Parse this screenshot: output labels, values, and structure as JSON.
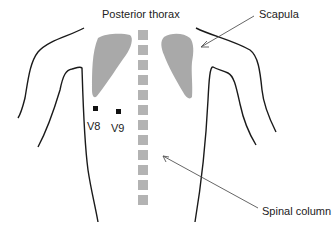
{
  "diagram": {
    "title": "Posterior thorax",
    "labels": {
      "scapula": "Scapula",
      "spinal_column": "Spinal column",
      "v8": "V8",
      "v9": "V9"
    },
    "colors": {
      "outline": "#1a1a1a",
      "scapula_fill": "#a9a9a9",
      "vertebra_fill": "#b3b3b3",
      "electrode": "#111111",
      "arrow": "#555555",
      "text": "#222222",
      "background": "#ffffff"
    },
    "vertebrae_count": 12,
    "electrodes": [
      {
        "name": "V8",
        "x": 96,
        "y": 109
      },
      {
        "name": "V9",
        "x": 119,
        "y": 112
      }
    ]
  }
}
